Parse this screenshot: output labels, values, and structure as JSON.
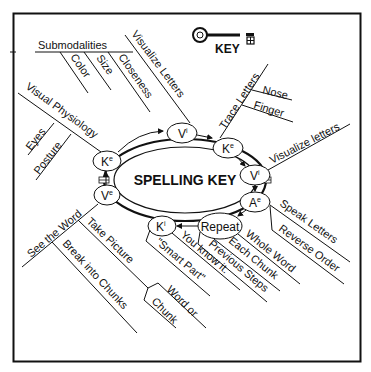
{
  "legend": {
    "key_label": "KEY"
  },
  "center": {
    "title": "SPELLING KEY"
  },
  "nodes": {
    "vi_top": {
      "base": "V",
      "sup": "i"
    },
    "ke_top": {
      "base": "K",
      "sup": "e"
    },
    "vi_right": {
      "base": "V",
      "sup": "i"
    },
    "ae": {
      "base": "A",
      "sup": "e"
    },
    "repeat": {
      "label": "Repeat"
    },
    "ki": {
      "base": "K",
      "sup": "i"
    },
    "ve": {
      "base": "V",
      "sup": "e"
    },
    "ke_left": {
      "base": "K",
      "sup": "e"
    }
  },
  "branches": {
    "visualize_letters_top": "Visualize Letters",
    "submodalities": "Submodalities",
    "color": "Color",
    "size": "Size",
    "closeness": "Closeness",
    "visual_physiology": "Visual  Physiology",
    "eyes": "Eyes",
    "posture": "Posture",
    "trace_letters": "Trace Letters",
    "nose": "Nose",
    "finger": "Finger",
    "visualize_letters_right": "Visualize letters",
    "speak_letters": "Speak Letters",
    "reverse_order": "Reverse Order",
    "whole_word": "Whole Word",
    "each_chunk": "Each Chunk",
    "previous_steps": "Previous Steps",
    "you_know_it": "You know it.",
    "smart_part": "\"Smart Part\"",
    "see_the_word": "See the Word",
    "take_picture": "Take Picture",
    "break_into_chunks": "Break into Chunks",
    "word_or": "Word or",
    "chunk": "Chunk"
  },
  "colors": {
    "ink": "#111111",
    "paper": "#ffffff"
  }
}
